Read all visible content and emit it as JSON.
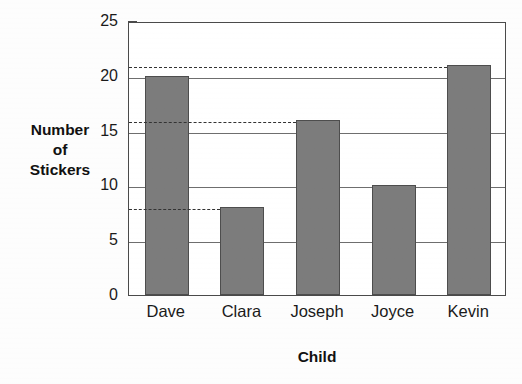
{
  "chart_data": {
    "type": "bar",
    "title": "",
    "categories": [
      "Dave",
      "Clara",
      "Joseph",
      "Joyce",
      "Kevin"
    ],
    "values": [
      20,
      8,
      16,
      10,
      21
    ],
    "xlabel": "Child",
    "ylabel": "Number of Stickers",
    "ylabel_lines": [
      "Number",
      "of",
      "Stickers"
    ],
    "ylim": [
      0,
      25
    ],
    "ytick_labels": [
      "0",
      "5",
      "10",
      "15",
      "20",
      "25"
    ],
    "ytick_values": [
      0,
      5,
      10,
      15,
      20,
      25
    ],
    "minor_tick_interval": 1,
    "gridlines": [
      5,
      10,
      15,
      20
    ],
    "grid": true,
    "legend": "none",
    "annotations": [
      {
        "name": "guide-line-kevin",
        "value": 21,
        "extends_to_category": "Kevin",
        "style": "dashed"
      },
      {
        "name": "guide-line-joseph",
        "value": 16,
        "extends_to_category": "Joseph",
        "style": "dashed"
      },
      {
        "name": "guide-line-clara",
        "value": 8,
        "extends_to_category": "Clara",
        "style": "dashed"
      }
    ],
    "colors": {
      "bar_fill": "#7c7c7c",
      "bar_border": "#4d4d4d",
      "axis": "#4a4a4a",
      "grid": "#6e6e6e",
      "dashed_guide": "#333333",
      "text": "#1a1a1a",
      "background": "#ffffff"
    }
  }
}
